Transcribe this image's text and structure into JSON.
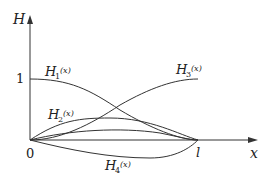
{
  "diagram": {
    "axes": {
      "y_label": "H",
      "x_label": "x",
      "origin_label": "0",
      "y_tick_label": "1",
      "x_end_label": "l"
    },
    "curves": [
      {
        "name": "H1",
        "label": "H",
        "subscript": "1",
        "arg": "(x)",
        "description": "starts at 1, decreases to 0 at l"
      },
      {
        "name": "H2",
        "label": "H",
        "subscript": "2",
        "arg": "(x)",
        "description": "starts at 0, rises to hump, returns to 0 at l"
      },
      {
        "name": "H3",
        "label": "H",
        "subscript": "3",
        "arg": "(x)",
        "description": "starts at 0, increases to 1 at l"
      },
      {
        "name": "H4",
        "label": "H",
        "subscript": "4",
        "arg": "(x)",
        "description": "starts at 0, dips below axis, returns to 0 at l"
      }
    ],
    "colors": {
      "line": "#333333",
      "background": "#ffffff"
    }
  }
}
